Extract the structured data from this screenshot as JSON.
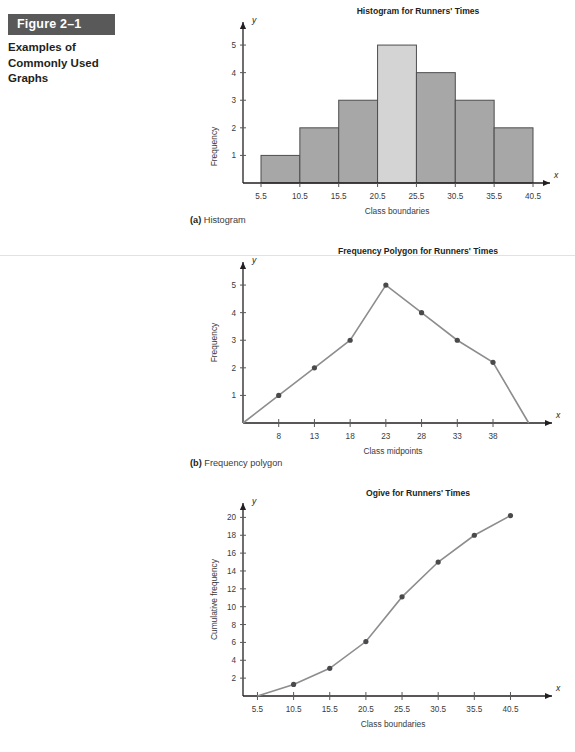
{
  "figure": {
    "label": "Figure 2–1",
    "caption": "Examples of Commonly Used Graphs",
    "header_bg": "#595959",
    "header_text_color": "#ffffff"
  },
  "captions": {
    "a_marker": "(a)",
    "a_text": "Histogram",
    "b_marker": "(b)",
    "b_text": "Frequency polygon"
  },
  "colors": {
    "bar_fill": "#a7a7a7",
    "bar_fill_highlight": "#d4d4d4",
    "bar_stroke": "#4d4d4f",
    "line": "#8d8d90",
    "dot": "#4a4a4c",
    "axis": "#231f20",
    "rule": "#e2e2e2"
  },
  "chart_data": [
    {
      "type": "bar",
      "title": "Histogram for Runners' Times",
      "xlabel": "Class boundaries",
      "ylabel": "Frequency",
      "x_axis_letter": "x",
      "y_axis_letter": "y",
      "boundaries": [
        5.5,
        10.5,
        15.5,
        20.5,
        25.5,
        30.5,
        35.5,
        40.5
      ],
      "xticks": [
        "5.5",
        "10.5",
        "15.5",
        "20.5",
        "25.5",
        "30.5",
        "35.5",
        "40.5"
      ],
      "values": [
        1,
        2,
        3,
        5,
        4,
        3,
        2
      ],
      "highlight_index": 3,
      "yticks": [
        1,
        2,
        3,
        4,
        5
      ],
      "ylim": [
        0,
        5.8
      ],
      "grid": false,
      "legend": "none"
    },
    {
      "type": "line",
      "title": "Frequency Polygon for Runners' Times",
      "xlabel": "Class midpoints",
      "ylabel": "Frequency",
      "x_axis_letter": "x",
      "y_axis_letter": "y",
      "x": [
        3,
        8,
        13,
        18,
        23,
        28,
        33,
        38,
        43
      ],
      "xticks": [
        "8",
        "13",
        "18",
        "23",
        "28",
        "33",
        "38"
      ],
      "xtick_values": [
        8,
        13,
        18,
        23,
        28,
        33,
        38
      ],
      "values": [
        0,
        1,
        2,
        3,
        5,
        4,
        3,
        2.2,
        0
      ],
      "marker_indices": [
        1,
        2,
        3,
        4,
        5,
        6,
        7
      ],
      "yticks": [
        1,
        2,
        3,
        4,
        5
      ],
      "ylim": [
        0,
        5.8
      ],
      "xlim": [
        3,
        45
      ],
      "grid": false,
      "legend": "none"
    },
    {
      "type": "line",
      "title": "Ogive for Runners' Times",
      "xlabel": "Class boundaries",
      "ylabel": "Cumulative frequency",
      "x_axis_letter": "x",
      "y_axis_letter": "y",
      "x": [
        5.5,
        10.5,
        15.5,
        20.5,
        25.5,
        30.5,
        35.5,
        40.5
      ],
      "xticks": [
        "5.5",
        "10.5",
        "15.5",
        "20.5",
        "25.5",
        "30.5",
        "35.5",
        "40.5"
      ],
      "xtick_values": [
        5.5,
        10.5,
        15.5,
        20.5,
        25.5,
        30.5,
        35.5,
        40.5
      ],
      "values": [
        0,
        1.3,
        3.1,
        6.1,
        11.1,
        15,
        18,
        20.2
      ],
      "marker_indices": [
        1,
        2,
        3,
        4,
        5,
        6,
        7
      ],
      "yticks": [
        2,
        4,
        6,
        8,
        10,
        12,
        14,
        16,
        18,
        20
      ],
      "ylim": [
        0,
        21.5
      ],
      "xlim": [
        3.5,
        45
      ],
      "grid": false,
      "legend": "none"
    }
  ]
}
